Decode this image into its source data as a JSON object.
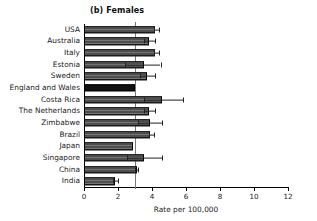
{
  "chart_data": {
    "type": "bar",
    "orientation": "horizontal",
    "title": "(b) Females",
    "xlabel": "Rate per 100,000",
    "ylabel": "",
    "xlim": [
      0,
      12
    ],
    "xticks": [
      0,
      2,
      4,
      6,
      8,
      10,
      12
    ],
    "xtick_labels": [
      "0",
      "2",
      "4",
      "6",
      "8",
      "10",
      "12"
    ],
    "grid": false,
    "legend": "none",
    "reference_line": {
      "value": 3.0,
      "label": "",
      "color": "#7a7a7a"
    },
    "highlight_category": "England and Wales",
    "highlight_color": "#111111",
    "bar_color": "#4e4e4e",
    "categories": [
      "USA",
      "Australia",
      "Italy",
      "Estonia",
      "Sweden",
      "England and Wales",
      "Costa Rica",
      "The Netherlands",
      "Zimbabwe",
      "Brazil",
      "Japan",
      "Singapore",
      "China",
      "India"
    ],
    "values": [
      4.2,
      3.8,
      4.2,
      3.5,
      3.7,
      3.0,
      4.6,
      3.8,
      3.9,
      3.9,
      2.9,
      3.5,
      3.1,
      1.8
    ],
    "error_low": [
      4.1,
      3.5,
      4.1,
      2.4,
      3.3,
      3.0,
      3.5,
      3.5,
      3.2,
      3.8,
      2.9,
      2.5,
      3.0,
      1.7
    ],
    "error_high": [
      4.4,
      4.2,
      4.4,
      4.5,
      4.2,
      3.0,
      5.8,
      4.2,
      4.6,
      4.1,
      2.9,
      4.6,
      3.2,
      2.0
    ]
  }
}
